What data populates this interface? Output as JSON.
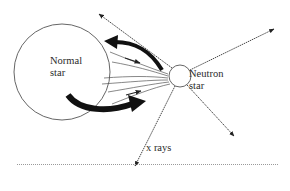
{
  "diagram": {
    "normal_star": {
      "label_line1": "Normal",
      "label_line2": "star"
    },
    "neutron_star": {
      "label_line1": "Neutron",
      "label_line2": "star"
    },
    "xray_label": "x rays",
    "colors": {
      "stroke": "#333333",
      "background": "#ffffff",
      "separator": "#9a9a9a"
    }
  }
}
